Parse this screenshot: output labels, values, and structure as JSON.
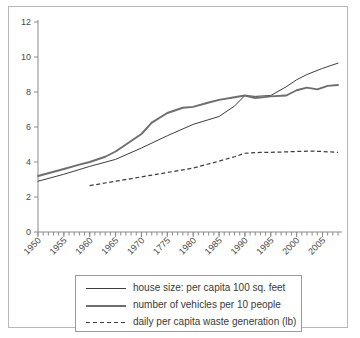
{
  "chart_data": {
    "type": "line",
    "title": "",
    "subtitle": "",
    "xlabel": "",
    "ylabel": "",
    "xlim": [
      1950,
      2008
    ],
    "ylim": [
      0,
      12
    ],
    "y_ticks": [
      0,
      2,
      4,
      6,
      8,
      10,
      12
    ],
    "x_ticks": [
      1950,
      1955,
      1960,
      1965,
      1970,
      1775,
      1980,
      1985,
      1990,
      1995,
      2000,
      2005
    ],
    "x_tick_labels": [
      "1950",
      "1955",
      "1960",
      "1965",
      "1970",
      "1775",
      "1980",
      "1985",
      "1990",
      "1995",
      "2000",
      "2005"
    ],
    "x_minor_tick_step": 1,
    "grid": false,
    "legend_position": "below-plot",
    "series": [
      {
        "name": "house size: per capita 100 sq. feet",
        "style": "solid-thin",
        "color": "#3d3d3d",
        "x": [
          1950,
          1955,
          1960,
          1965,
          1970,
          1975,
          1980,
          1985,
          1988,
          1990,
          1992,
          1995,
          1998,
          2000,
          2002,
          2005,
          2008
        ],
        "y": [
          2.9,
          3.3,
          3.75,
          4.15,
          4.8,
          5.5,
          6.15,
          6.6,
          7.2,
          7.8,
          7.75,
          7.8,
          8.3,
          8.7,
          9.0,
          9.35,
          9.65
        ]
      },
      {
        "name": "number of vehicles per 10 people",
        "style": "solid-thick",
        "color": "#6e6e6e",
        "x": [
          1950,
          1955,
          1958,
          1960,
          1963,
          1965,
          1968,
          1970,
          1972,
          1975,
          1978,
          1980,
          1983,
          1985,
          1988,
          1990,
          1992,
          1995,
          1998,
          2000,
          2002,
          2004,
          2006,
          2008
        ],
        "y": [
          3.2,
          3.6,
          3.85,
          4.0,
          4.3,
          4.6,
          5.2,
          5.6,
          6.25,
          6.8,
          7.1,
          7.15,
          7.4,
          7.55,
          7.7,
          7.8,
          7.65,
          7.75,
          7.8,
          8.1,
          8.25,
          8.15,
          8.35,
          8.4
        ]
      },
      {
        "name": "daily per capita waste generation (lb)",
        "style": "dashed",
        "color": "#3d3d3d",
        "x": [
          1960,
          1965,
          1970,
          1975,
          1980,
          1985,
          1988,
          1990,
          1993,
          1995,
          2000,
          2003,
          2005,
          2008
        ],
        "y": [
          2.65,
          2.9,
          3.15,
          3.4,
          3.65,
          4.05,
          4.3,
          4.5,
          4.55,
          4.55,
          4.6,
          4.62,
          4.6,
          4.55
        ]
      }
    ]
  },
  "legend": {
    "items": [
      {
        "label": "house size: per capita 100 sq. feet",
        "swatch": "solid-thin-line-icon"
      },
      {
        "label": "number of vehicles per 10 people",
        "swatch": "solid-thick-line-icon"
      },
      {
        "label": "daily per capita waste generation (lb)",
        "swatch": "dashed-line-icon"
      }
    ]
  }
}
